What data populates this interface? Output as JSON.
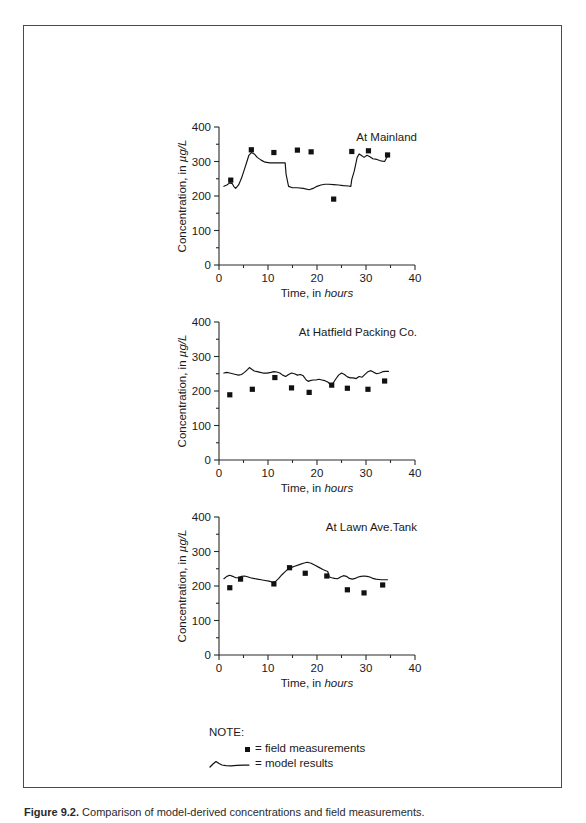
{
  "figure": {
    "axis": {
      "xlabel_prefix": "Time, in ",
      "xlabel_italic": "hours",
      "ylabel_prefix": "Concentration, in ",
      "ylabel_italic": "µg/L",
      "x_ticks": [
        0,
        10,
        20,
        30,
        40
      ],
      "y_ticks": [
        0,
        100,
        200,
        300,
        400
      ],
      "xlim": [
        0,
        40
      ],
      "ylim": [
        0,
        400
      ],
      "x_minor_step": 5,
      "y_minor_step": 50
    },
    "legend": {
      "note_label": "NOTE:",
      "field_label": "= field measurements",
      "model_label": "= model results",
      "field_symbol": "filled-square-marker",
      "model_symbol": "wavy-line-sample"
    },
    "caption": {
      "label": "Figure 9.2.",
      "text": "Comparison of model-derived concentrations and field measurements."
    }
  },
  "chart_data": [
    {
      "type": "line",
      "title": "At Mainland",
      "xlabel": "Time, in hours",
      "ylabel": "Concentration, in µg/L",
      "xlim": [
        0,
        40
      ],
      "ylim": [
        0,
        400
      ],
      "grid": false,
      "series": [
        {
          "name": "model results",
          "type": "line",
          "x": [
            1.0,
            1.6,
            2.2,
            2.7,
            3.0,
            3.4,
            4.0,
            4.6,
            5.2,
            5.7,
            6.1,
            6.6,
            7.2,
            7.8,
            8.6,
            9.4,
            10.4,
            11.6,
            12.8,
            13.5,
            13.7,
            14.2,
            15.0,
            16.0,
            17.2,
            18.4,
            19.2,
            20.0,
            20.8,
            21.6,
            22.4,
            23.4,
            24.4,
            25.4,
            26.4,
            26.9,
            27.1,
            27.6,
            28.2,
            28.6,
            29.0,
            29.6,
            30.2,
            30.8,
            31.4,
            32.2,
            33.0,
            33.8,
            34.4
          ],
          "y": [
            228,
            232,
            238,
            236,
            228,
            222,
            232,
            252,
            278,
            300,
            318,
            326,
            322,
            312,
            304,
            298,
            296,
            296,
            296,
            296,
            262,
            228,
            224,
            224,
            222,
            218,
            222,
            228,
            232,
            234,
            234,
            233,
            232,
            230,
            229,
            228,
            248,
            272,
            312,
            322,
            318,
            312,
            318,
            314,
            308,
            306,
            302,
            300,
            316
          ]
        },
        {
          "name": "field measurements",
          "type": "scatter",
          "x": [
            2.4,
            6.6,
            11.2,
            16.0,
            18.8,
            23.4,
            27.1,
            30.5,
            34.4
          ],
          "y": [
            246,
            334,
            326,
            333,
            328,
            191,
            329,
            331,
            319
          ]
        }
      ]
    },
    {
      "type": "line",
      "title": "At Hatfield Packing Co.",
      "xlabel": "Time, in hours",
      "ylabel": "Concentration, in µg/L",
      "xlim": [
        0,
        40
      ],
      "ylim": [
        0,
        400
      ],
      "grid": false,
      "series": [
        {
          "name": "model results",
          "type": "line",
          "x": [
            1.0,
            1.6,
            2.2,
            2.8,
            3.4,
            4.0,
            4.6,
            5.2,
            5.8,
            6.2,
            6.6,
            7.2,
            7.8,
            8.4,
            9.0,
            9.8,
            10.6,
            11.2,
            11.8,
            12.4,
            13.0,
            13.6,
            14.2,
            14.8,
            15.4,
            16.0,
            16.6,
            17.2,
            17.8,
            18.2,
            18.6,
            19.2,
            19.8,
            20.4,
            21.0,
            21.6,
            22.2,
            22.8,
            23.2,
            23.8,
            24.4,
            25.0,
            25.6,
            26.2,
            26.8,
            27.4,
            28.0,
            28.6,
            29.2,
            29.8,
            30.4,
            31.0,
            31.6,
            32.2,
            32.8,
            33.4,
            34.0,
            34.6
          ],
          "y": [
            252,
            254,
            252,
            250,
            248,
            246,
            248,
            254,
            262,
            268,
            264,
            258,
            256,
            254,
            252,
            252,
            254,
            256,
            255,
            252,
            246,
            242,
            248,
            252,
            250,
            246,
            248,
            244,
            232,
            228,
            230,
            232,
            232,
            234,
            232,
            230,
            226,
            218,
            221,
            234,
            246,
            252,
            248,
            241,
            238,
            238,
            236,
            242,
            240,
            248,
            256,
            259,
            254,
            250,
            252,
            256,
            257,
            257
          ]
        },
        {
          "name": "field measurements",
          "type": "scatter",
          "x": [
            2.2,
            6.8,
            11.4,
            14.8,
            18.4,
            23.0,
            26.2,
            30.4,
            33.8
          ],
          "y": [
            189,
            205,
            239,
            209,
            196,
            217,
            208,
            205,
            229
          ]
        }
      ]
    },
    {
      "type": "line",
      "title": "At Lawn Ave.Tank",
      "xlabel": "Time, in hours",
      "ylabel": "Concentration, in µg/L",
      "xlim": [
        0,
        40
      ],
      "ylim": [
        0,
        400
      ],
      "grid": false,
      "series": [
        {
          "name": "model results",
          "type": "line",
          "x": [
            1.0,
            1.6,
            2.2,
            2.8,
            3.4,
            4.0,
            4.6,
            5.2,
            5.8,
            6.4,
            7.0,
            7.8,
            8.6,
            9.4,
            10.2,
            11.0,
            11.6,
            12.2,
            12.8,
            13.4,
            14.0,
            14.8,
            15.6,
            16.4,
            17.2,
            18.0,
            18.8,
            19.6,
            20.4,
            21.2,
            21.8,
            22.2,
            22.5,
            23.0,
            23.6,
            24.2,
            24.8,
            25.4,
            26.0,
            26.6,
            27.2,
            27.8,
            28.4,
            29.0,
            29.6,
            30.2,
            30.8,
            31.4,
            32.0,
            32.6,
            33.2,
            33.8,
            34.4
          ],
          "y": [
            221,
            228,
            231,
            228,
            224,
            224,
            228,
            229,
            227,
            224,
            222,
            220,
            218,
            216,
            214,
            211,
            214,
            222,
            232,
            240,
            248,
            254,
            258,
            262,
            266,
            269,
            266,
            260,
            254,
            248,
            244,
            242,
            226,
            224,
            222,
            221,
            226,
            230,
            228,
            222,
            220,
            222,
            226,
            228,
            229,
            228,
            226,
            222,
            220,
            219,
            218,
            218,
            218
          ]
        },
        {
          "name": "field measurements",
          "type": "scatter",
          "x": [
            2.2,
            4.4,
            11.2,
            14.4,
            17.6,
            22.0,
            26.2,
            29.6,
            33.4
          ],
          "y": [
            195,
            220,
            206,
            253,
            237,
            229,
            189,
            180,
            203
          ]
        }
      ]
    }
  ]
}
